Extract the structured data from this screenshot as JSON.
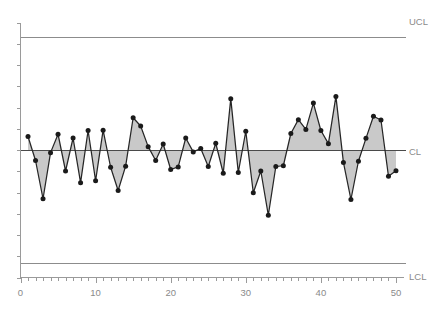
{
  "chart_data": {
    "type": "line",
    "title": "",
    "subtitle": "",
    "xlabel": "",
    "ylabel": "",
    "grid": false,
    "legend_position": "none",
    "xlim": [
      0,
      51
    ],
    "ylim": [
      -3.4,
      3.4
    ],
    "xticks_major": [
      0,
      10,
      20,
      30,
      40,
      50
    ],
    "xtick_labels": [
      "0",
      "10",
      "20",
      "30",
      "40",
      "50"
    ],
    "xticks_minor_step": 1,
    "yticks_count": 13,
    "ytick_labels": [],
    "annotations": [
      {
        "name": "ucl",
        "label": "UCL",
        "value": 3.0
      },
      {
        "name": "cl",
        "label": "CL",
        "value": 0.0
      },
      {
        "name": "lcl",
        "label": "LCL",
        "value": -3.0
      }
    ],
    "series": [
      {
        "name": "observation",
        "x": [
          1,
          2,
          3,
          4,
          5,
          6,
          7,
          8,
          9,
          10,
          11,
          12,
          13,
          14,
          15,
          16,
          17,
          18,
          19,
          20,
          21,
          22,
          23,
          24,
          25,
          26,
          27,
          28,
          29,
          30,
          31,
          32,
          33,
          34,
          35,
          36,
          37,
          38,
          39,
          40,
          41,
          42,
          43,
          44,
          45,
          46,
          47,
          48,
          49,
          50
        ],
        "values": [
          0.36,
          -0.28,
          -1.3,
          -0.07,
          0.42,
          -0.56,
          0.32,
          -0.87,
          0.52,
          -0.82,
          0.53,
          -0.46,
          -1.08,
          -0.43,
          0.86,
          0.64,
          0.09,
          -0.28,
          0.16,
          -0.52,
          -0.45,
          0.32,
          -0.05,
          0.04,
          -0.44,
          0.18,
          -0.62,
          1.37,
          -0.6,
          0.5,
          -1.14,
          -0.56,
          -1.74,
          -0.44,
          -0.42,
          0.44,
          0.81,
          0.55,
          1.25,
          0.52,
          0.17,
          1.43,
          -0.33,
          -1.32,
          -0.3,
          0.31,
          0.9,
          0.8,
          -0.7,
          -0.55
        ]
      }
    ]
  },
  "axes": {
    "x_axis_name": "sample-number-axis",
    "y_axis_name": "value-axis"
  },
  "labels": {
    "ucl": "UCL",
    "cl": "CL",
    "lcl": "LCL"
  },
  "colors": {
    "series_line": "#262626",
    "series_fill": "#a8a8a8",
    "point": "#1a1a1a",
    "axis": "#9a9a9a",
    "center_line": "#4a4a4a",
    "limit_line": "#8c8c8c",
    "label_text": "#8a8a8a",
    "background": "#ffffff"
  }
}
